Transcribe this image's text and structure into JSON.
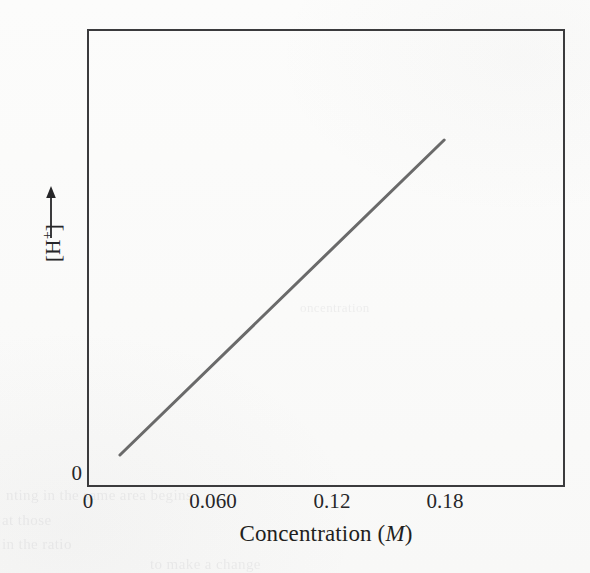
{
  "figure": {
    "background_color": "#fbfbfa",
    "frame_color": "#3b3b3d",
    "text_color": "#262628"
  },
  "ghost_text": {
    "line_a": "nting in the same area begins",
    "line_b": "at those",
    "line_c": "in the ratio",
    "line_d": "to make a change",
    "line_e": "oncentration"
  },
  "axes": {
    "y": {
      "title_open_bracket": "[H",
      "title_charge": "+",
      "title_close_bracket": "]",
      "title_plain": "[H+]",
      "zero_label": "0",
      "arrow_direction": "up"
    },
    "x": {
      "title_prefix": "Concentration (",
      "title_unit": "M",
      "title_suffix": ")",
      "title_plain": "Concentration (M)",
      "ticks": [
        {
          "label": "0",
          "value": 0
        },
        {
          "label": "0.060",
          "value": 0.06
        },
        {
          "label": "0.12",
          "value": 0.12
        },
        {
          "label": "0.18",
          "value": 0.18
        }
      ]
    }
  },
  "chart_data": {
    "type": "line",
    "title": "",
    "xlabel": "Concentration (M)",
    "ylabel": "[H+]",
    "xlim": [
      0,
      0.2409
    ],
    "ylim": [
      0,
      1
    ],
    "grid": false,
    "legend": null,
    "axis_ticks_x": [
      0,
      0.06,
      0.12,
      0.18
    ],
    "axis_ticks_y": [
      0
    ],
    "series": [
      {
        "name": "[H+] vs concentration",
        "color": "#6a6a6a",
        "line_width": 3,
        "x": [
          0.0166,
          0.18
        ],
        "y": [
          0.0699,
          0.7576
        ],
        "description": "Straight line of positive constant slope, starting just above the origin and rising to the 0.18 M tick."
      }
    ]
  }
}
